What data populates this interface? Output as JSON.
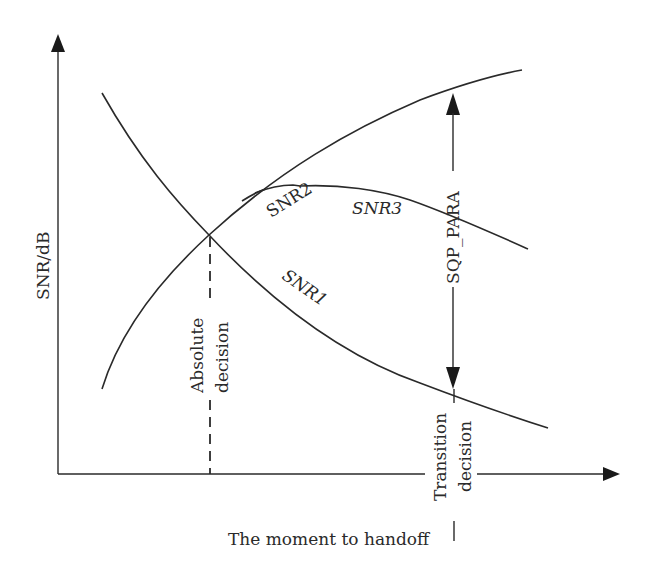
{
  "diagram": {
    "axes": {
      "y_label": "SNR/dB",
      "x_label": "The moment to handoff"
    },
    "curves": [
      {
        "id": "snr1",
        "label": "SNR1",
        "description": "decreasing signal curve"
      },
      {
        "id": "snr2",
        "label": "SNR2",
        "description": "rising signal curve, branch point"
      },
      {
        "id": "snr3",
        "label": "SNR3",
        "description": "plateau then falling curve"
      }
    ],
    "markers": {
      "absolute_decision": {
        "line1": "Absolute",
        "line2": "decision"
      },
      "transition_decision": {
        "line1": "Transition",
        "line2": "decision"
      },
      "margin": {
        "label": "SQP_PARA"
      }
    },
    "colors": {
      "ink": "#2a2a2a",
      "background": "#ffffff"
    }
  }
}
